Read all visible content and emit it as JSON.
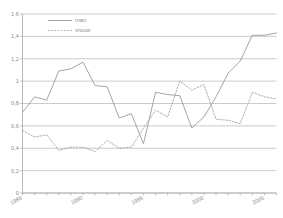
{
  "chart_data": {
    "type": "line",
    "title": "",
    "xlabel": "",
    "ylabel": "",
    "xlim": [
      1985,
      2006
    ],
    "ylim": [
      0,
      1.6
    ],
    "grid": true,
    "legend_position": "top-left",
    "x": [
      1985,
      1986,
      1987,
      1988,
      1989,
      1990,
      1991,
      1992,
      1993,
      1994,
      1995,
      1996,
      1997,
      1998,
      1999,
      2000,
      2001,
      2002,
      2003,
      2004,
      2005,
      2006
    ],
    "xticklabels": [
      "1985",
      "1990",
      "1995",
      "2000",
      "2005"
    ],
    "xtickvalues": [
      1985,
      1990,
      1995,
      2000,
      2005
    ],
    "yticklabels": [
      "0",
      "0,2",
      "0,4",
      "0,6",
      "0,8",
      "1",
      "1,2",
      "1,4",
      "1,6"
    ],
    "ytickvalues": [
      0,
      0.2,
      0.4,
      0.6,
      0.8,
      1.0,
      1.2,
      1.4,
      1.6
    ],
    "series": [
      {
        "name": "man",
        "style": "solid",
        "color": "#9a9a9a",
        "values": [
          0.72,
          0.86,
          0.83,
          1.09,
          1.11,
          1.17,
          0.96,
          0.95,
          0.67,
          0.71,
          0.44,
          0.9,
          0.88,
          0.87,
          0.58,
          0.68,
          0.86,
          1.07,
          1.18,
          1.41,
          1.41,
          1.43
        ]
      },
      {
        "name": "vrouw",
        "style": "dotted",
        "color": "#a5a5a5",
        "values": [
          0.56,
          0.5,
          0.52,
          0.38,
          0.41,
          0.41,
          0.37,
          0.47,
          0.4,
          0.41,
          0.58,
          0.74,
          0.68,
          1.0,
          0.92,
          0.97,
          0.66,
          0.65,
          0.62,
          0.9,
          0.86,
          0.84
        ]
      }
    ]
  },
  "legend": {
    "entries": [
      {
        "label": "man"
      },
      {
        "label": "vrouw"
      }
    ]
  }
}
